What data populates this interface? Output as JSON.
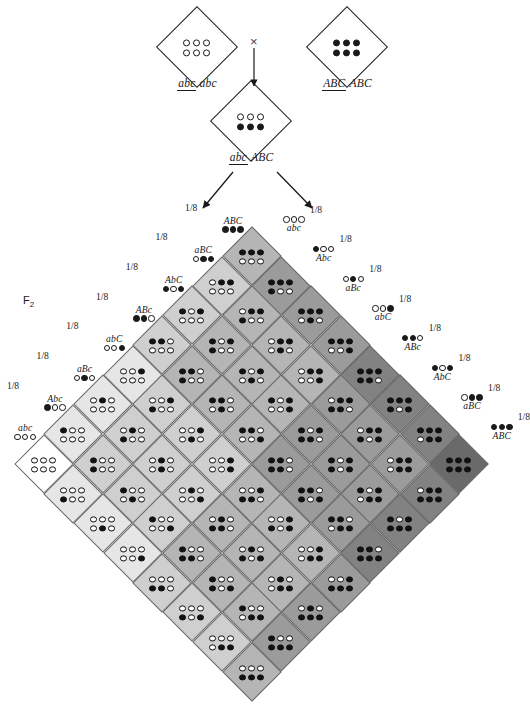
{
  "figure": {
    "f2_label": "F",
    "f2_sub": "2",
    "cross_symbol": "×"
  },
  "parents": {
    "left": {
      "name": "recessive-parent",
      "genotype_numerator": "abc",
      "genotype_denominator": "abc",
      "dots_top": [
        "o",
        "o",
        "o"
      ],
      "dots_bottom": [
        "o",
        "o",
        "o"
      ]
    },
    "right": {
      "name": "dominant-parent",
      "genotype_numerator": "ABC",
      "genotype_denominator": "ABC",
      "dots_top": [
        "f",
        "f",
        "f"
      ],
      "dots_bottom": [
        "f",
        "f",
        "f"
      ]
    },
    "f1": {
      "name": "f1-hybrid",
      "genotype_numerator": "abc",
      "genotype_denominator": "ABC",
      "dots_top": [
        "o",
        "o",
        "o"
      ],
      "dots_bottom": [
        "f",
        "f",
        "f"
      ]
    }
  },
  "gametes": {
    "frequency_label": "1/8",
    "left_column_top_to_bottom": [
      {
        "label": "ABC",
        "dots": [
          "f",
          "f",
          "f"
        ]
      },
      {
        "label": "aBC",
        "dots": [
          "o",
          "f",
          "f"
        ]
      },
      {
        "label": "AbC",
        "dots": [
          "f",
          "o",
          "f"
        ]
      },
      {
        "label": "ABc",
        "dots": [
          "f",
          "f",
          "o"
        ]
      },
      {
        "label": "abC",
        "dots": [
          "o",
          "o",
          "f"
        ]
      },
      {
        "label": "aBc",
        "dots": [
          "o",
          "f",
          "o"
        ]
      },
      {
        "label": "Abc",
        "dots": [
          "f",
          "o",
          "o"
        ]
      },
      {
        "label": "abc",
        "dots": [
          "o",
          "o",
          "o"
        ]
      }
    ],
    "right_column_top_to_bottom": [
      {
        "label": "abc",
        "dots": [
          "o",
          "o",
          "o"
        ]
      },
      {
        "label": "Abc",
        "dots": [
          "f",
          "o",
          "o"
        ]
      },
      {
        "label": "aBc",
        "dots": [
          "o",
          "f",
          "o"
        ]
      },
      {
        "label": "abC",
        "dots": [
          "o",
          "o",
          "f"
        ]
      },
      {
        "label": "ABc",
        "dots": [
          "f",
          "f",
          "o"
        ]
      },
      {
        "label": "AbC",
        "dots": [
          "f",
          "o",
          "f"
        ]
      },
      {
        "label": "aBC",
        "dots": [
          "o",
          "f",
          "f"
        ]
      },
      {
        "label": "ABC",
        "dots": [
          "f",
          "f",
          "f"
        ]
      }
    ]
  },
  "punnett": {
    "rows": 8,
    "cols": 8,
    "shade_scale": [
      "#ffffff",
      "#e6e6e6",
      "#cfcfcf",
      "#b5b5b5",
      "#9b9b9b",
      "#828282",
      "#6a6a6a",
      "#4f4f4f",
      "#3a3a3a"
    ],
    "row_gametes": [
      "ABC",
      "aBC",
      "AbC",
      "ABc",
      "abC",
      "aBc",
      "Abc",
      "abc"
    ],
    "col_gametes": [
      "abc",
      "Abc",
      "aBc",
      "abC",
      "ABc",
      "AbC",
      "aBC",
      "ABC"
    ]
  }
}
